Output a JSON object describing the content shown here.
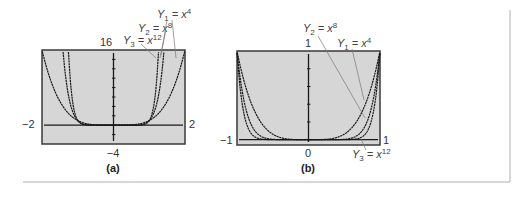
{
  "figure": {
    "panels": [
      {
        "caption": "(a)",
        "x_min_label": "−2",
        "x_max_label": "2",
        "y_max_label": "16",
        "y_min_label": "−4",
        "annotations": {
          "y1": {
            "name": "Y",
            "sub": "1",
            "eq": " = x",
            "sup": "4"
          },
          "y2": {
            "name": "Y",
            "sub": "2",
            "eq": " = x",
            "sup": "8"
          },
          "y3": {
            "name": "Y",
            "sub": "3",
            "eq": " = x",
            "sup": "12"
          }
        }
      },
      {
        "caption": "(b)",
        "x_min_label": "−1",
        "x_max_label": "1",
        "y_max_label": "1",
        "y_min_label": "0",
        "annotations": {
          "y1": {
            "name": "Y",
            "sub": "1",
            "eq": " = x",
            "sup": "4"
          },
          "y2": {
            "name": "Y",
            "sub": "2",
            "eq": " = x",
            "sup": "8"
          },
          "y3": {
            "name": "Y",
            "sub": "3",
            "eq": " = x",
            "sup": "12"
          }
        }
      }
    ],
    "colors": {
      "plot_bg": "#d6d6d6",
      "frame": "#3a3a3a",
      "curve": "#1a1a1a",
      "divider": "#b0b0b0"
    }
  },
  "chart_data": [
    {
      "type": "line",
      "title": "(a)",
      "xlabel": "",
      "ylabel": "",
      "xlim": [
        -2,
        2
      ],
      "ylim": [
        -4,
        16
      ],
      "grid": false,
      "legend_position": "annotations above plot, pointing to curves",
      "series": [
        {
          "name": "Y1 = x^4",
          "function": "x^4"
        },
        {
          "name": "Y2 = x^8",
          "function": "x^8"
        },
        {
          "name": "Y3 = x^12",
          "function": "x^12"
        }
      ],
      "tick_labels": {
        "x": [
          "−2",
          "2"
        ],
        "y": [
          "−4",
          "16"
        ]
      }
    },
    {
      "type": "line",
      "title": "(b)",
      "xlabel": "",
      "ylabel": "",
      "xlim": [
        -1,
        1
      ],
      "ylim": [
        0,
        1
      ],
      "grid": false,
      "legend_position": "annotations above and below plot, pointing to curves",
      "series": [
        {
          "name": "Y1 = x^4",
          "function": "x^4"
        },
        {
          "name": "Y2 = x^8",
          "function": "x^8"
        },
        {
          "name": "Y3 = x^12",
          "function": "x^12"
        }
      ],
      "tick_labels": {
        "x": [
          "−1",
          "0",
          "1"
        ],
        "y": [
          "0",
          "1"
        ]
      }
    }
  ]
}
